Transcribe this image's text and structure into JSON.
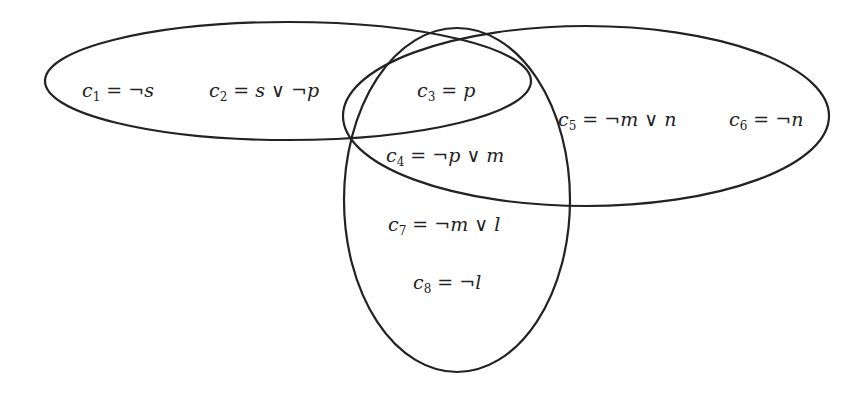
{
  "diagram": {
    "type": "venn",
    "stroke_color": "#222222",
    "background": "#ffffff",
    "sets": [
      {
        "name": "left-horizontal-ellipse",
        "cx": 288,
        "cy": 81,
        "rx": 243,
        "ry": 59,
        "rotate": 0
      },
      {
        "name": "right-horizontal-ellipse",
        "cx": 586,
        "cy": 116,
        "rx": 243,
        "ry": 90,
        "rotate": 0
      },
      {
        "name": "vertical-ellipse",
        "cx": 457,
        "cy": 200,
        "rx": 113,
        "ry": 172,
        "rotate": 0
      }
    ],
    "clauses": [
      {
        "id": "c1",
        "var": "c",
        "sub": "1",
        "expr": "= ¬s",
        "x": 82,
        "y": 97
      },
      {
        "id": "c2",
        "var": "c",
        "sub": "2",
        "expr": "= s ∨ ¬p",
        "x": 209,
        "y": 97
      },
      {
        "id": "c3",
        "var": "c",
        "sub": "3",
        "expr": "= p",
        "x": 417,
        "y": 97
      },
      {
        "id": "c4",
        "var": "c",
        "sub": "4",
        "expr": "= ¬p ∨ m",
        "x": 386,
        "y": 162
      },
      {
        "id": "c5",
        "var": "c",
        "sub": "5",
        "expr": "= ¬m ∨ n",
        "x": 558,
        "y": 126
      },
      {
        "id": "c6",
        "var": "c",
        "sub": "6",
        "expr": "= ¬n",
        "x": 729,
        "y": 126
      },
      {
        "id": "c7",
        "var": "c",
        "sub": "7",
        "expr": "= ¬m ∨ l",
        "x": 388,
        "y": 231
      },
      {
        "id": "c8",
        "var": "c",
        "sub": "8",
        "expr": "= ¬l",
        "x": 413,
        "y": 289
      }
    ]
  }
}
